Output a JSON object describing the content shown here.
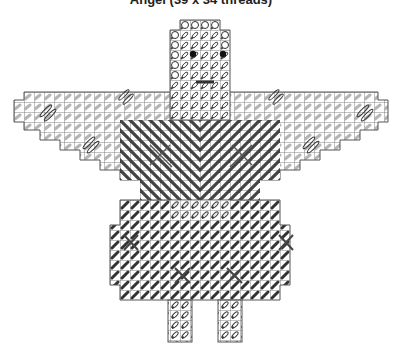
{
  "title": "Angel (39 x 34 threads)",
  "footer_text": "",
  "grid": {
    "cell_px": 10,
    "line_color": "#555555",
    "stitch_colors": {
      "light": "#b8b8b8",
      "medium": "#7a7a7a",
      "dark": "#3a3a3a",
      "eye": "#111111"
    }
  },
  "legend": {
    "symbols": [
      {
        "name": "light-tent-stitch",
        "color": "#b8b8b8"
      },
      {
        "name": "dark-tent-stitch",
        "color": "#3a3a3a"
      },
      {
        "name": "diagonal-long-stitch",
        "color": "#444444"
      },
      {
        "name": "outlined-loop-stitch",
        "color": "#222222"
      },
      {
        "name": "overcast-circle-edge",
        "color": "#222222"
      },
      {
        "name": "french-knot-eye",
        "color": "#111111"
      }
    ]
  }
}
